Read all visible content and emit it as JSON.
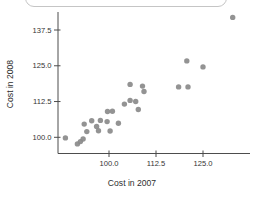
{
  "chart_data": {
    "type": "scatter",
    "title": "",
    "xlabel": "Cost in 2007",
    "ylabel": "Cost in 2008",
    "legend": null,
    "grid": false,
    "xlim": [
      86.5,
      137.5
    ],
    "ylim": [
      94,
      144
    ],
    "x_ticks": {
      "values": [
        100.0,
        112.5,
        125.0
      ],
      "labels": [
        "100.0",
        "112.5",
        "125.0"
      ]
    },
    "y_ticks": {
      "values": [
        137.5,
        125.0,
        112.5,
        100.0
      ],
      "labels": [
        "137.5",
        "125.0",
        "112.5",
        "100.0"
      ]
    },
    "points": [
      [
        88.4,
        99.8
      ],
      [
        91.6,
        97.7
      ],
      [
        92.4,
        98.5
      ],
      [
        93.1,
        99.4
      ],
      [
        94.1,
        102.0
      ],
      [
        93.4,
        104.6
      ],
      [
        95.4,
        105.8
      ],
      [
        96.7,
        103.8
      ],
      [
        97.2,
        102.3
      ],
      [
        97.7,
        105.9
      ],
      [
        99.6,
        109.0
      ],
      [
        100.9,
        109.1
      ],
      [
        99.5,
        105.5
      ],
      [
        100.3,
        102.2
      ],
      [
        102.5,
        104.9
      ],
      [
        104.1,
        111.6
      ],
      [
        105.6,
        112.9
      ],
      [
        107.1,
        112.5
      ],
      [
        107.8,
        109.7
      ],
      [
        105.6,
        118.5
      ],
      [
        108.9,
        117.9
      ],
      [
        109.3,
        116.0
      ],
      [
        118.5,
        117.6
      ],
      [
        121.0,
        117.6
      ],
      [
        120.7,
        126.7
      ],
      [
        125.0,
        124.6
      ],
      [
        132.9,
        141.9
      ]
    ]
  },
  "colors": {
    "point": "#8a8a8a",
    "axis": "#4d4d4d",
    "tick": "#4d4d4d",
    "tick_label": "#333333",
    "card_border": "#c5c5c5",
    "background": "#ffffff"
  }
}
